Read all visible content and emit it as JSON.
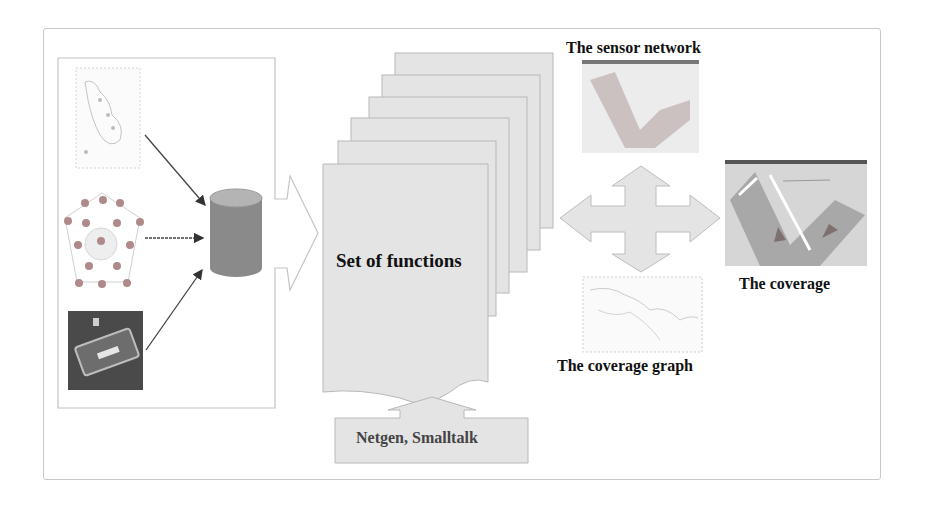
{
  "diagram": {
    "center_label": "Set of functions",
    "tools_label": "Netgen, Smalltalk",
    "outputs": {
      "sensor_network": "The sensor network",
      "coverage": "The coverage",
      "coverage_graph": "The coverage graph"
    },
    "inputs": [
      {
        "name": "terrain-map",
        "kind": "image"
      },
      {
        "name": "sensor-node-graph",
        "kind": "image"
      },
      {
        "name": "satellite-photo",
        "kind": "image"
      }
    ],
    "stack_pages": 6,
    "colors": {
      "page_fill": "#e4e4e4",
      "page_stroke": "#b8b8b8",
      "database": "#8a8a8a",
      "database_top": "#b4b4b4",
      "arrow": "#444444",
      "frame": "#c8c8c8"
    }
  }
}
